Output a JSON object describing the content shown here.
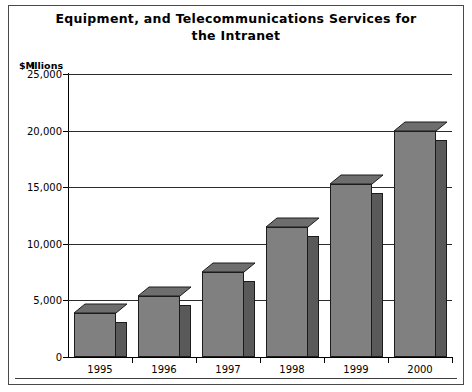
{
  "chart_data": {
    "type": "bar",
    "title": "Equipment, and Telecommunications Services for the Intranet",
    "title_line1": "Equipment, and Telecommunications Services for",
    "title_line2": "the Intranet",
    "xlabel": "",
    "ylabel": "$Millions",
    "ylabel_currency": "$M",
    "ylabel_rest": "illions",
    "categories": [
      "1995",
      "1996",
      "1997",
      "1998",
      "1999",
      "2000"
    ],
    "values": [
      3900,
      5400,
      7500,
      11500,
      15300,
      20000
    ],
    "ylim": [
      0,
      25000
    ],
    "yticks": [
      0,
      5000,
      10000,
      15000,
      20000,
      25000
    ],
    "ytick_labels": [
      "0",
      "5,000",
      "10,000",
      "15,000",
      "20,000",
      "25,000"
    ],
    "grid": true,
    "legend": "none",
    "style": "3d-bar",
    "colors": {
      "bar_front": "#808080",
      "bar_side": "#595959",
      "bar_top": "#6e6e6e",
      "bar_outline": "#1c1c1c",
      "gridline": "#2b2b2b",
      "axis": "#000000",
      "frame": "#4a4a4a",
      "background": "#ffffff",
      "text": "#000000"
    }
  }
}
